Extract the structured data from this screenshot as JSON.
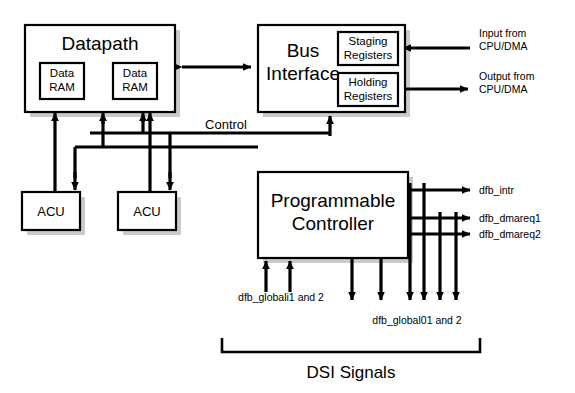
{
  "diagram": {
    "colors": {
      "line": "#000000",
      "fill": "#ffffff",
      "shadow": "#b8b8b8"
    },
    "blocks": {
      "datapath": {
        "label": "Datapath",
        "x": 25,
        "y": 25,
        "w": 150,
        "h": 87
      },
      "data_ram_1": {
        "label_line1": "Data",
        "label_line2": "RAM",
        "x": 40,
        "y": 63,
        "w": 44,
        "h": 36
      },
      "data_ram_2": {
        "label_line1": "Data",
        "label_line2": "RAM",
        "x": 113,
        "y": 63,
        "w": 44,
        "h": 36
      },
      "bus_interface": {
        "label_line1": "Bus",
        "label_line2": "Interface",
        "x": 258,
        "y": 25,
        "w": 147,
        "h": 87
      },
      "staging_registers": {
        "label_line1": "Staging",
        "label_line2": "Registers",
        "x": 338,
        "y": 32,
        "w": 60,
        "h": 33
      },
      "holding_registers": {
        "label_line1": "Holding",
        "label_line2": "Registers",
        "x": 338,
        "y": 73,
        "w": 60,
        "h": 33
      },
      "acu_1": {
        "label": "ACU",
        "x": 22,
        "y": 192,
        "w": 58,
        "h": 38
      },
      "acu_2": {
        "label": "ACU",
        "x": 118,
        "y": 192,
        "w": 58,
        "h": 38
      },
      "programmable_controller": {
        "label_line1": "Programmable",
        "label_line2": "Controller",
        "x": 258,
        "y": 172,
        "w": 150,
        "h": 86
      }
    },
    "labels": {
      "control": "Control",
      "input_from": {
        "line1": "Input from",
        "line2": "CPU/DMA"
      },
      "output_from": {
        "line1": "Output from",
        "line2": "CPU/DMA"
      },
      "dfb_intr": "dfb_intr",
      "dfb_dmareq1": "dfb_dmareq1",
      "dfb_dmareq2": "dfb_dmareq2",
      "dfb_globali": "dfb_globali1 and 2",
      "dfb_global0": "dfb_global01 and 2",
      "dsi_signals": "DSI Signals"
    }
  }
}
